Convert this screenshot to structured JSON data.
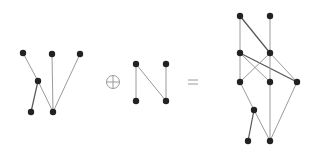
{
  "diagram": {
    "operator_plus": "⊕",
    "operator_equals": "=",
    "colors": {
      "node": "#222222",
      "edge": "#9a9a9a",
      "operator": "#9a9a9a"
    },
    "graphs": [
      {
        "name": "left-poset",
        "nodes": [
          "a1",
          "a2",
          "a3",
          "a4",
          "a5",
          "a6"
        ],
        "edges": [
          [
            "a1",
            "a4"
          ],
          [
            "a4",
            "a5"
          ],
          [
            "a4",
            "a6"
          ],
          [
            "a2",
            "a6"
          ],
          [
            "a3",
            "a6"
          ]
        ]
      },
      {
        "name": "n-poset",
        "nodes": [
          "n1",
          "n2",
          "n3",
          "n4"
        ],
        "edges": [
          [
            "n1",
            "n3"
          ],
          [
            "n1",
            "n4"
          ],
          [
            "n2",
            "n4"
          ]
        ]
      },
      {
        "name": "result-poset",
        "nodes": [
          "A",
          "B",
          "C",
          "D",
          "E",
          "F",
          "G",
          "H",
          "I",
          "J"
        ],
        "edges": [
          [
            "A",
            "C"
          ],
          [
            "A",
            "D"
          ],
          [
            "B",
            "D"
          ],
          [
            "C",
            "E"
          ],
          [
            "C",
            "F"
          ],
          [
            "C",
            "G"
          ],
          [
            "D",
            "E"
          ],
          [
            "D",
            "F"
          ],
          [
            "D",
            "G"
          ],
          [
            "E",
            "H"
          ],
          [
            "H",
            "I"
          ],
          [
            "H",
            "J"
          ],
          [
            "F",
            "J"
          ],
          [
            "G",
            "J"
          ]
        ]
      }
    ]
  }
}
